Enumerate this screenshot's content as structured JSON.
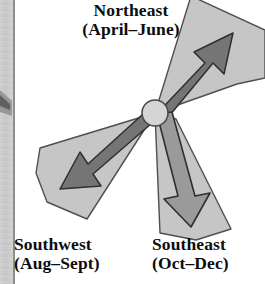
{
  "figure": {
    "background_color": "#ffffff"
  },
  "page_edge": {
    "strip_color": "#d4d4d4",
    "rule_color": "#8d8d8d"
  },
  "hub": {
    "fill": "#d5d5d5",
    "stroke": "#4a4a4a",
    "cx": 155,
    "cy": 113,
    "r": 13
  },
  "palette": {
    "wedge_fill": "#c6c6c6",
    "wedge_stroke": "#4f4f4f",
    "arrow_dark_fill": "#757575",
    "arrow_mid_fill": "#9a9a9a",
    "arrow_stroke": "#2f2f2f"
  },
  "directions": [
    {
      "id": "northeast",
      "name": "Northeast",
      "season": "(April–June)",
      "bearing_label": "up-right",
      "arrow_fill": "#757575",
      "wedge_fill": "#c6c6c6"
    },
    {
      "id": "southwest",
      "name": "Southwest",
      "season": "(Aug–Sept)",
      "bearing_label": "down-left",
      "arrow_fill": "#757575",
      "wedge_fill": "#c6c6c6"
    },
    {
      "id": "southeast",
      "name": "Southeast",
      "season": "(Oct–Dec)",
      "bearing_label": "down",
      "arrow_fill": "#9a9a9a",
      "wedge_fill": "#c6c6c6"
    }
  ]
}
